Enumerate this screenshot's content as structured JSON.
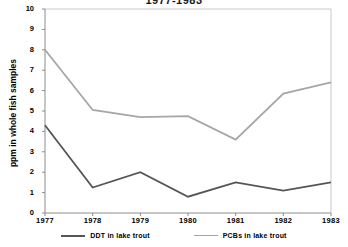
{
  "chart_data": {
    "type": "line",
    "title": "1977-1983",
    "xlabel": "",
    "ylabel": "ppm in whole fish samples",
    "categories": [
      "1977",
      "1978",
      "1979",
      "1980",
      "1981",
      "1982",
      "1983"
    ],
    "x": [
      1977,
      1978,
      1979,
      1980,
      1981,
      1982,
      1983
    ],
    "ylim": [
      0,
      10
    ],
    "yticks": [
      "0",
      "1",
      "2",
      "3",
      "4",
      "5",
      "6",
      "7",
      "8",
      "9",
      "10"
    ],
    "grid": false,
    "legend_position": "bottom",
    "series": [
      {
        "name": "DDT in lake trout",
        "color": "#555555",
        "values": [
          4.3,
          1.25,
          2.0,
          0.8,
          1.5,
          1.1,
          1.5
        ]
      },
      {
        "name": "PCBs in lake trout",
        "color": "#a6a6a6",
        "values": [
          8.0,
          5.05,
          4.7,
          4.75,
          3.6,
          5.85,
          6.4
        ]
      }
    ]
  },
  "axis": {
    "frame_color": "#c8c8c8",
    "text_color": "#000000"
  }
}
